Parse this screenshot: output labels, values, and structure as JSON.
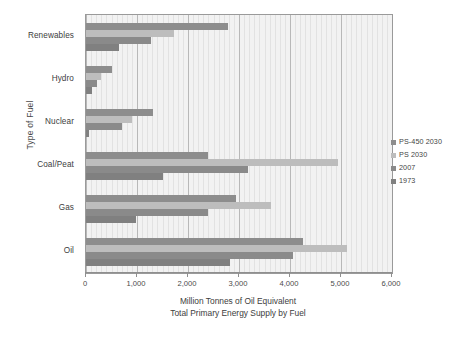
{
  "chart_data": {
    "type": "bar",
    "orientation": "horizontal",
    "title": "",
    "xlabel": "Million Tonnes of Oil Equivalent",
    "xlabel_line2": "Total Primary Energy Supply by Fuel",
    "ylabel": "Type of Fuel",
    "xlim": [
      0,
      6000
    ],
    "xticks": [
      0,
      1000,
      2000,
      3000,
      4000,
      5000,
      6000
    ],
    "xtick_labels": [
      "0",
      "1,000",
      "2,000",
      "3,000",
      "4,000",
      "5,000",
      "6,000"
    ],
    "grid": true,
    "legend_position": "right",
    "categories": [
      "Renewables",
      "Hydro",
      "Nuclear",
      "Coal/Peat",
      "Gas",
      "Oil"
    ],
    "series": [
      {
        "name": "PS-450 2030",
        "color": "#8d8d8d",
        "values": [
          2780,
          510,
          1320,
          2400,
          2950,
          4250
        ]
      },
      {
        "name": "PS 2030",
        "color": "#bdbdbd",
        "values": [
          1720,
          300,
          900,
          4950,
          3620,
          5120
        ]
      },
      {
        "name": "2007",
        "color": "#8a8a8a",
        "values": [
          1270,
          220,
          710,
          3180,
          2400,
          4050
        ]
      },
      {
        "name": "1973",
        "color": "#808080",
        "values": [
          640,
          110,
          60,
          1510,
          980,
          2820
        ]
      }
    ]
  },
  "legend": {
    "items": [
      {
        "label": "PS-450 2030"
      },
      {
        "label": "PS 2030"
      },
      {
        "label": "2007"
      },
      {
        "label": "1973"
      }
    ]
  }
}
